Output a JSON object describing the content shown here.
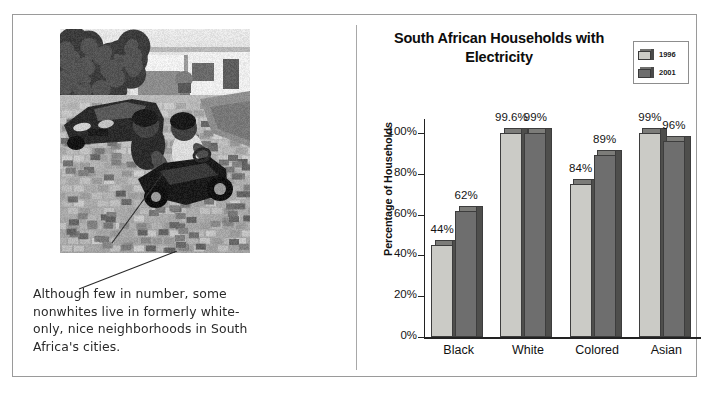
{
  "figure": {
    "photo": {
      "alt_description": "black-and-white photograph of two young children riding a toy car on a paved driveway, with a sedan and white suburban houses behind them"
    },
    "caption": "Although few in number, some nonwhites live in formerly white-only, nice neighborhoods in South Africa's cities."
  },
  "chart_data": {
    "type": "bar",
    "title": "South African Households with Electricity",
    "xlabel": "",
    "ylabel": "Percentage of Households",
    "categories": [
      "Black",
      "White",
      "Colored",
      "Asian"
    ],
    "series": [
      {
        "name": "1996",
        "color": "#cbcbc6",
        "values": [
          44,
          99.6,
          84,
          99
        ],
        "labels": [
          "44%",
          "99.6%",
          "84%",
          "99%"
        ],
        "plotted_heights": [
          45,
          100,
          75,
          100
        ]
      },
      {
        "name": "2001",
        "color": "#6e6e6e",
        "values": [
          62,
          99,
          89,
          96
        ],
        "labels": [
          "62%",
          "99%",
          "89%",
          "96%"
        ],
        "plotted_heights": [
          62,
          100,
          89,
          96
        ]
      }
    ],
    "ylim": [
      0,
      100
    ],
    "yticks": [
      0,
      20,
      40,
      60,
      80,
      100
    ],
    "ytick_labels": [
      "0%",
      "20%",
      "40%",
      "60%",
      "80%",
      "100%"
    ],
    "grid": false,
    "legend": {
      "position": "top-right",
      "entries": [
        {
          "label": "1996",
          "color": "#cbcbc6"
        },
        {
          "label": "2001",
          "color": "#6e6e6e"
        }
      ]
    }
  }
}
